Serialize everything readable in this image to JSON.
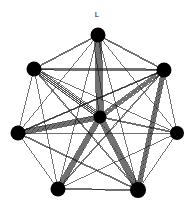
{
  "figure": {
    "type": "graph-diagram",
    "width": 196,
    "height": 209,
    "background_color": "#ffffff",
    "node_color": "#000000",
    "edge_color": "#1a1a1a",
    "label_color": "#1a1a1a"
  },
  "labels": [
    {
      "text": "L",
      "x": 97,
      "y": 15
    }
  ],
  "chart_data": {
    "type": "graph",
    "title": "",
    "nodes": [
      {
        "id": "n0",
        "name": "top",
        "x": 98,
        "y": 35,
        "r": 7.5
      },
      {
        "id": "n1",
        "name": "upper-left",
        "x": 34,
        "y": 69,
        "r": 7.5
      },
      {
        "id": "n2",
        "name": "upper-right",
        "x": 164,
        "y": 70,
        "r": 7.5
      },
      {
        "id": "n3",
        "name": "left",
        "x": 18,
        "y": 133,
        "r": 7.5
      },
      {
        "id": "n4",
        "name": "right",
        "x": 177,
        "y": 133,
        "r": 7.0
      },
      {
        "id": "n5",
        "name": "lower-left",
        "x": 58,
        "y": 189,
        "r": 7.5
      },
      {
        "id": "n6",
        "name": "lower-right",
        "x": 138,
        "y": 190,
        "r": 8.0
      },
      {
        "id": "c",
        "name": "center-hub",
        "x": 100,
        "y": 117,
        "r": 6.5
      }
    ],
    "edges": [
      {
        "source": "n0",
        "target": "c",
        "multiplicity": 9
      },
      {
        "source": "n1",
        "target": "c",
        "multiplicity": 7
      },
      {
        "source": "n3",
        "target": "c",
        "multiplicity": 7
      },
      {
        "source": "n2",
        "target": "c",
        "multiplicity": 6
      },
      {
        "source": "n5",
        "target": "c",
        "multiplicity": 7
      },
      {
        "source": "n6",
        "target": "c",
        "multiplicity": 8
      },
      {
        "source": "n4",
        "target": "c",
        "multiplicity": 2
      },
      {
        "source": "n2",
        "target": "n6",
        "multiplicity": 6
      },
      {
        "source": "n0",
        "target": "n1",
        "multiplicity": 2
      },
      {
        "source": "n0",
        "target": "n2",
        "multiplicity": 2
      },
      {
        "source": "n1",
        "target": "n3",
        "multiplicity": 1
      },
      {
        "source": "n2",
        "target": "n4",
        "multiplicity": 1
      },
      {
        "source": "n3",
        "target": "n5",
        "multiplicity": 1
      },
      {
        "source": "n4",
        "target": "n6",
        "multiplicity": 1
      },
      {
        "source": "n5",
        "target": "n6",
        "multiplicity": 2
      },
      {
        "source": "n1",
        "target": "n2",
        "multiplicity": 3
      },
      {
        "source": "n1",
        "target": "n4",
        "multiplicity": 1
      },
      {
        "source": "n1",
        "target": "n6",
        "multiplicity": 2
      },
      {
        "source": "n1",
        "target": "n5",
        "multiplicity": 1
      },
      {
        "source": "n0",
        "target": "n3",
        "multiplicity": 1
      },
      {
        "source": "n0",
        "target": "n4",
        "multiplicity": 1
      },
      {
        "source": "n0",
        "target": "n5",
        "multiplicity": 1
      },
      {
        "source": "n0",
        "target": "n6",
        "multiplicity": 1
      },
      {
        "source": "n3",
        "target": "n2",
        "multiplicity": 2
      },
      {
        "source": "n3",
        "target": "n4",
        "multiplicity": 1
      },
      {
        "source": "n3",
        "target": "n6",
        "multiplicity": 2
      },
      {
        "source": "n5",
        "target": "n2",
        "multiplicity": 2
      },
      {
        "source": "n5",
        "target": "n4",
        "multiplicity": 1
      },
      {
        "source": "n2",
        "target": "n3",
        "multiplicity": 1
      }
    ],
    "layout": "ring-with-hub",
    "legend": null,
    "grid": false
  }
}
